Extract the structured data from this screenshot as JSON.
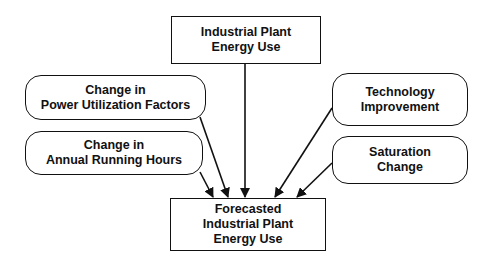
{
  "diagram": {
    "source": {
      "lines": [
        "Industrial Plant",
        "Energy Use"
      ]
    },
    "factors": [
      {
        "lines": [
          "Change in",
          "Power Utilization Factors"
        ]
      },
      {
        "lines": [
          "Change in",
          "Annual Running Hours"
        ]
      },
      {
        "lines": [
          "Technology",
          "Improvement"
        ]
      },
      {
        "lines": [
          "Saturation",
          "Change"
        ]
      }
    ],
    "result": {
      "lines": [
        "Forecasted",
        "Industrial Plant",
        "Energy Use"
      ]
    },
    "colors": {
      "stroke": "#111111",
      "background": "#ffffff"
    }
  }
}
